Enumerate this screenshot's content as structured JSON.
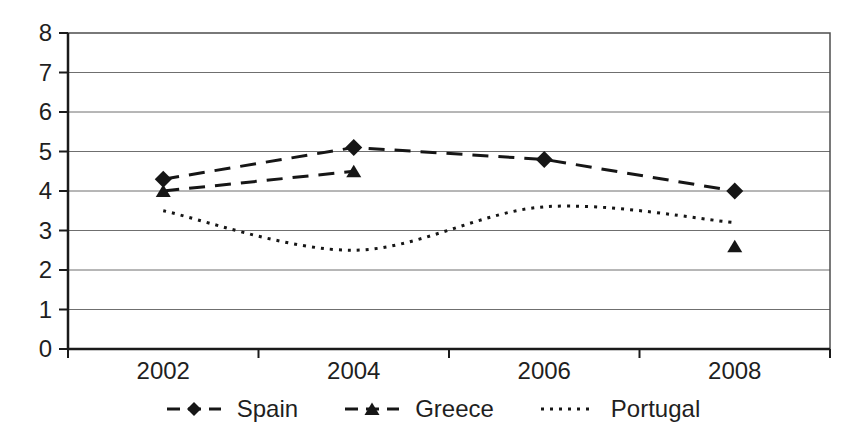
{
  "chart_data": {
    "type": "line",
    "title": "",
    "xlabel": "",
    "ylabel": "",
    "categories": [
      "2002",
      "2004",
      "2006",
      "2008"
    ],
    "series": [
      {
        "name": "Spain",
        "values": [
          4.3,
          5.1,
          4.8,
          4.0
        ],
        "marker": "diamond",
        "line_style": "long-dash",
        "color": "#161616"
      },
      {
        "name": "Greece",
        "values": [
          4.0,
          4.5,
          null,
          2.6
        ],
        "marker": "triangle",
        "line_style": "long-dash",
        "color": "#161616"
      },
      {
        "name": "Portugal",
        "values": [
          3.5,
          2.5,
          3.6,
          3.2
        ],
        "marker": "none",
        "line_style": "dotted",
        "color": "#161616",
        "smooth": true
      }
    ],
    "ylim": [
      0,
      8
    ],
    "ytick_step": 1,
    "yticks": [
      "0",
      "1",
      "2",
      "3",
      "4",
      "5",
      "6",
      "7",
      "8"
    ],
    "grid": "horizontal-only",
    "legend_position": "bottom-center",
    "grid_color": "#6f6f6f",
    "border_color": "#4d4d4d",
    "axis_color": "#1a1a1a",
    "text_color": "#1f1f1f"
  }
}
